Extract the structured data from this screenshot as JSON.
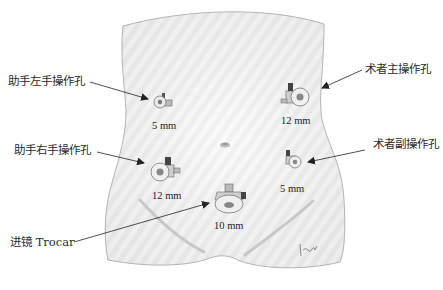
{
  "diagram": {
    "title": "",
    "colors": {
      "skin_fill": "#ececec",
      "skin_stripe": "#f9f9f9",
      "outline": "#9a9a9a",
      "arrow": "#222222",
      "text": "#2a2a2a",
      "trocar_body": "#d9d9d9",
      "trocar_dark": "#555555"
    },
    "ports": [
      {
        "id": "assistant-left",
        "label": "助手左手操作孔",
        "size": "5 mm"
      },
      {
        "id": "surgeon-main",
        "label": "术者主操作孔",
        "size": "12 mm"
      },
      {
        "id": "assistant-right",
        "label": "助手右手操作孔",
        "size": "12 mm"
      },
      {
        "id": "surgeon-secondary",
        "label": "术者副操作孔",
        "size": "5 mm"
      },
      {
        "id": "scope",
        "label": "进镜 Trocar",
        "size": "10 mm"
      }
    ],
    "signature": "Ipaul"
  }
}
